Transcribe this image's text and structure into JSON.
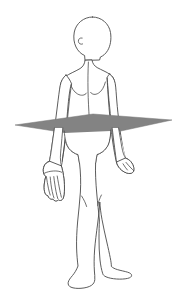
{
  "image": {
    "title": "Human body with transverse plane",
    "subject": "anatomical-figure-anterior-view",
    "background_color": "#ffffff",
    "width": 185,
    "height": 298
  },
  "figure": {
    "name": "human-body-outline",
    "outline_color": "#4a4a4a",
    "fill_color": "#ffffff",
    "stroke_width": 0.9,
    "parts": [
      "head",
      "neck",
      "left-shoulder",
      "right-shoulder",
      "torso",
      "left-arm",
      "right-arm",
      "left-hand",
      "right-hand",
      "hips",
      "left-leg",
      "right-leg",
      "left-foot",
      "right-foot"
    ]
  },
  "plane": {
    "name": "transverse-plane",
    "shape": "parallelogram",
    "color": "#838383",
    "edge_color": "#6f6f6f",
    "opacity": 1,
    "left_tip_x": 15,
    "right_tip_x": 172,
    "center_y": 125,
    "front_edge_y": 137,
    "back_edge_y": 114
  }
}
